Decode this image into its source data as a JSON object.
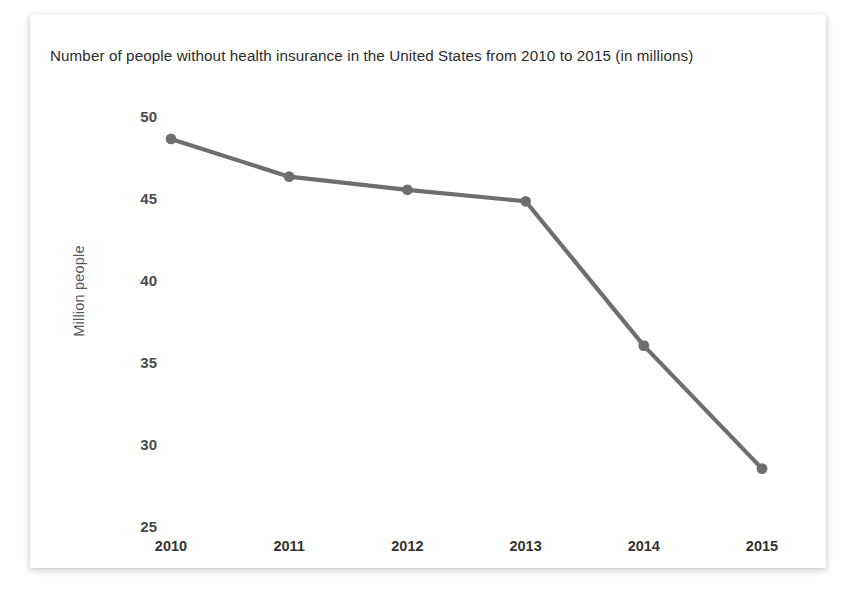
{
  "chart_data": {
    "type": "line",
    "title": "Number of people without health insurance in the United States from 2010 to 2015 (in millions)",
    "xlabel": "",
    "ylabel": "Million people",
    "categories": [
      "2010",
      "2011",
      "2012",
      "2013",
      "2014",
      "2015"
    ],
    "values": [
      48.6,
      46.3,
      45.5,
      44.8,
      36.0,
      28.5
    ],
    "series": [
      {
        "name": "Number of people without health insurance",
        "values": [
          48.6,
          46.3,
          45.5,
          44.8,
          36.0,
          28.5
        ]
      }
    ],
    "ylim": [
      25,
      50
    ],
    "yticks": [
      "50",
      "45",
      "40",
      "35",
      "30",
      "25"
    ],
    "ytick_values": [
      50,
      45,
      40,
      35,
      30,
      25
    ],
    "grid": false,
    "legend": false,
    "legend_position": "none",
    "line_color": "#6e6e6e",
    "marker_color": "#6e6e6e",
    "marker_shape": "circle",
    "background_color": "#ffffff",
    "title_color": "#2b2b2b",
    "tick_color": "#4a4a4a",
    "axis_label_color": "#595959"
  }
}
